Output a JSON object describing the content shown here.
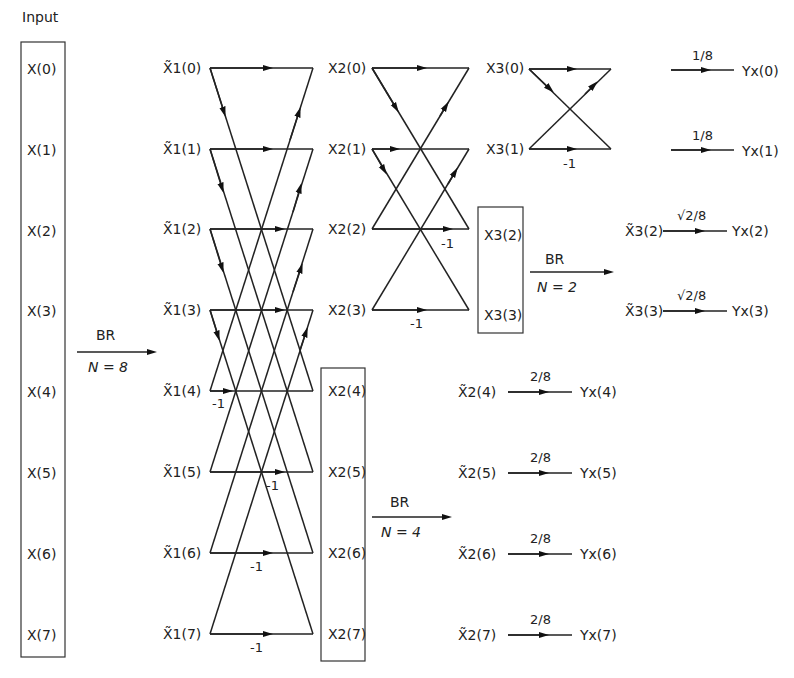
{
  "title": "Input",
  "input": {
    "labels": [
      "X(0)",
      "X(1)",
      "X(2)",
      "X(3)",
      "X(4)",
      "X(5)",
      "X(6)",
      "X(7)"
    ]
  },
  "br8": {
    "top": "BR",
    "bottom": "N = 8"
  },
  "stage1": {
    "labels": [
      "X̃1(0)",
      "X̃1(1)",
      "X̃1(2)",
      "X̃1(3)",
      "X̃1(4)",
      "X̃1(5)",
      "X̃1(6)",
      "X̃1(7)"
    ],
    "minus_labels": [
      "-1",
      "-1",
      "-1",
      "-1"
    ]
  },
  "stage2": {
    "labels": [
      "X2(0)",
      "X2(1)",
      "X2(2)",
      "X2(3)"
    ],
    "minus_labels": [
      "-1",
      "-1"
    ],
    "boxed_labels": [
      "X2(4)",
      "X2(5)",
      "X2(6)",
      "X2(7)"
    ]
  },
  "br4": {
    "top": "BR",
    "bottom": "N = 4"
  },
  "stage3": {
    "labels": [
      "X3(0)",
      "X3(1)"
    ],
    "minus_label": "-1",
    "boxed_labels": [
      "X3(2)",
      "X3(3)"
    ]
  },
  "br2": {
    "top": "BR",
    "bottom": "N = 2"
  },
  "outputs": [
    {
      "source": "",
      "gain": "1/8",
      "target": "Yx(0)"
    },
    {
      "source": "",
      "gain": "1/8",
      "target": "Yx(1)"
    },
    {
      "source": "X̃3(2)",
      "gain": "√2/8",
      "target": "Yx(2)"
    },
    {
      "source": "X̃3(3)",
      "gain": "√2/8",
      "target": "Yx(3)"
    },
    {
      "source": "X̃2(4)",
      "gain": "2/8",
      "target": "Yx(4)"
    },
    {
      "source": "X̃2(5)",
      "gain": "2/8",
      "target": "Yx(5)"
    },
    {
      "source": "X̃2(6)",
      "gain": "2/8",
      "target": "Yx(6)"
    },
    {
      "source": "X̃2(7)",
      "gain": "2/8",
      "target": "Yx(7)"
    }
  ]
}
